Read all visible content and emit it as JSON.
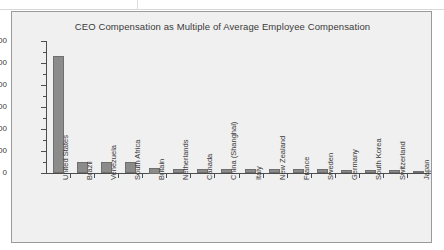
{
  "chart_data": {
    "type": "bar",
    "title": "CEO Compensation as Multiple of Average Employee Compensation",
    "xlabel": "",
    "ylabel": "",
    "ylim": [
      0,
      600
    ],
    "yticks": [
      0,
      100,
      200,
      300,
      400,
      500,
      600
    ],
    "grid": false,
    "legend": false,
    "bar_color": "#8b8b8b",
    "categories": [
      "United States",
      "Brazil",
      "Venezuela",
      "South Africa",
      "Britain",
      "Netherlands",
      "Canada",
      "China (Shanghai)",
      "Italy",
      "New Zealand",
      "France",
      "Sweden",
      "Germany",
      "South Korea",
      "Switzerland",
      "Japan"
    ],
    "values": [
      530,
      50,
      48,
      48,
      25,
      20,
      20,
      18,
      18,
      18,
      17,
      17,
      15,
      12,
      14,
      11
    ]
  },
  "axis": {
    "y_tick_labels": [
      "0",
      "100",
      "200",
      "300",
      "400",
      "500",
      "600"
    ]
  }
}
